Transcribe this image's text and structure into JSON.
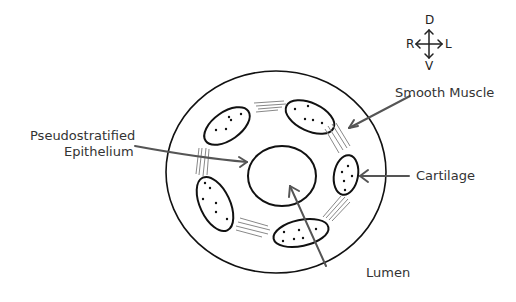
{
  "compass": {
    "dorsal": "D",
    "ventral": "V",
    "right": "R",
    "left": "L"
  },
  "labels": {
    "smooth_muscle": "Smooth Muscle",
    "epithelium_line1": "Pseudostratified",
    "epithelium_line2": "Epithelium",
    "cartilage": "Cartilage",
    "lumen": "Lumen"
  },
  "colors": {
    "outline": "#111111",
    "arrow": "#555555",
    "muscle_lines": "#888888",
    "text": "#333333"
  }
}
